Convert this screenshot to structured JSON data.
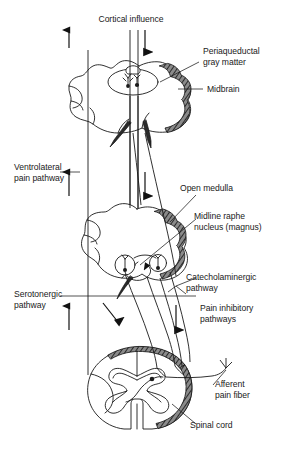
{
  "figure": {
    "type": "anatomical-schematic",
    "background_color": "#ffffff",
    "line_color": "#1a1a1a",
    "shading_color": "#4d4d4d"
  },
  "labels": {
    "cortical_influence": "Cortical influence",
    "periaqueductal_gray": "Periaqueductal\ngray matter",
    "midbrain": "Midbrain",
    "ventrolateral_pain_pathway": "Ventrolateral\npain pathway",
    "open_medulla": "Open medulla",
    "midline_raphe_nucleus": "Midline raphe\nnucleus (magnus)",
    "catecholaminergic_pathway": "Catecholaminergic\npathway",
    "serotonergic_pathway": "Serotonergic\npathway",
    "pain_inhibitory_pathways": "Pain inhibitory\npathways",
    "afferent_pain_fiber": "Afferent\npain fiber",
    "spinal_cord": "Spinal cord"
  },
  "structures": [
    {
      "name": "midbrain-section",
      "label_ref": "midbrain"
    },
    {
      "name": "periaqueductal-gray-nucleus",
      "label_ref": "periaqueductal_gray"
    },
    {
      "name": "open-medulla-section",
      "label_ref": "open_medulla"
    },
    {
      "name": "raphe-magnus-nucleus",
      "label_ref": "midline_raphe_nucleus"
    },
    {
      "name": "spinal-cord-section",
      "label_ref": "spinal_cord"
    }
  ],
  "pathways": [
    {
      "name": "ventrolateral-pain-pathway",
      "direction": "ascending",
      "label_ref": "ventrolateral_pain_pathway"
    },
    {
      "name": "cortical-descending-tract",
      "direction": "descending",
      "label_ref": "cortical_influence"
    },
    {
      "name": "serotonergic-pathway",
      "direction": "ascending",
      "label_ref": "serotonergic_pathway"
    },
    {
      "name": "catecholaminergic-pathway",
      "direction": "descending",
      "label_ref": "catecholaminergic_pathway"
    },
    {
      "name": "pain-inhibitory-pathways",
      "direction": "descending",
      "label_ref": "pain_inhibitory_pathways"
    },
    {
      "name": "afferent-pain-fiber",
      "direction": "afferent",
      "label_ref": "afferent_pain_fiber"
    }
  ]
}
